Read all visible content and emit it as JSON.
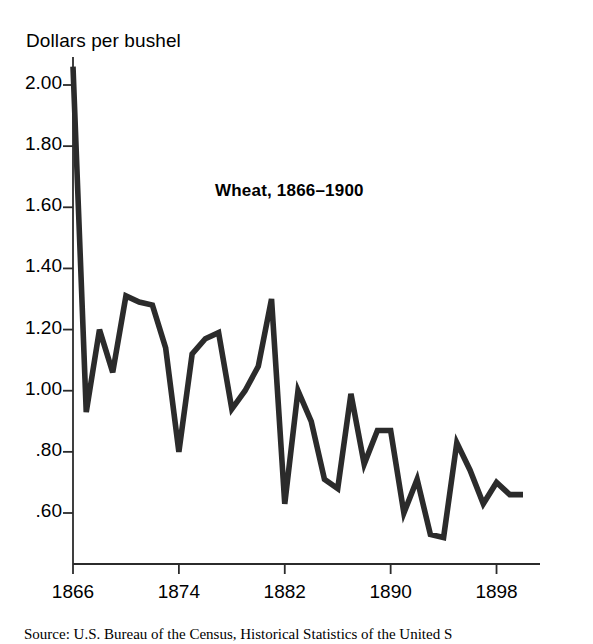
{
  "figure": {
    "axis_title": "Dollars per bushel",
    "source_note": "Source: U.S. Bureau of the Census, Historical Statistics of the United S"
  },
  "chart_data": {
    "type": "line",
    "title": "Wheat, 1866–1900",
    "xlabel": "",
    "ylabel": "Dollars per bushel",
    "grid": false,
    "legend": "none",
    "line_color": "#2b2b2b",
    "xlim": [
      1866,
      1900
    ],
    "ylim": [
      0.45,
      2.1
    ],
    "xticks": [
      1866,
      1874,
      1882,
      1890,
      1898
    ],
    "xtick_labels": [
      "1866",
      "1874",
      "1882",
      "1890",
      "1898"
    ],
    "yticks": [
      2.0,
      1.8,
      1.6,
      1.4,
      1.2,
      1.0,
      0.8,
      0.6
    ],
    "ytick_labels": [
      "2.00",
      "1.80",
      "1.60",
      "1.40",
      "1.20",
      "1.00",
      ".80",
      ".60"
    ],
    "x": [
      1866,
      1867,
      1868,
      1869,
      1870,
      1871,
      1872,
      1873,
      1874,
      1875,
      1876,
      1877,
      1878,
      1879,
      1880,
      1881,
      1882,
      1883,
      1884,
      1885,
      1886,
      1887,
      1888,
      1889,
      1890,
      1891,
      1892,
      1893,
      1894,
      1895,
      1896,
      1897,
      1898,
      1899,
      1900
    ],
    "values": [
      2.06,
      0.93,
      1.2,
      1.06,
      1.31,
      1.29,
      1.28,
      1.14,
      0.8,
      1.12,
      1.17,
      1.19,
      0.94,
      1.0,
      1.08,
      1.3,
      0.63,
      1.0,
      0.9,
      0.71,
      0.68,
      0.99,
      0.76,
      0.87,
      0.87,
      0.6,
      0.71,
      0.53,
      0.52,
      0.83,
      0.74,
      0.63,
      0.7,
      0.66,
      0.66
    ],
    "series_name": "Wheat price"
  }
}
